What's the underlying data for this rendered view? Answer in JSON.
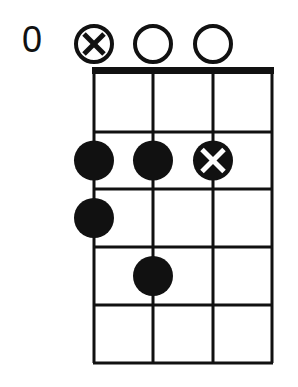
{
  "diagram": {
    "type": "chord-diagram",
    "start_fret_label": "0",
    "strings": 4,
    "frets": 5,
    "string_markers": [
      {
        "string": 1,
        "marker": "circle-x-icon"
      },
      {
        "string": 2,
        "marker": "open-circle-icon"
      },
      {
        "string": 3,
        "marker": "open-circle-icon"
      }
    ],
    "dots": [
      {
        "string": 1,
        "fret": 2,
        "style": "filled"
      },
      {
        "string": 2,
        "fret": 2,
        "style": "filled"
      },
      {
        "string": 3,
        "fret": 2,
        "style": "x"
      },
      {
        "string": 1,
        "fret": 3,
        "style": "filled"
      },
      {
        "string": 2,
        "fret": 4,
        "style": "filled"
      }
    ],
    "colors": {
      "ink": "#111111",
      "background": "#ffffff"
    }
  }
}
